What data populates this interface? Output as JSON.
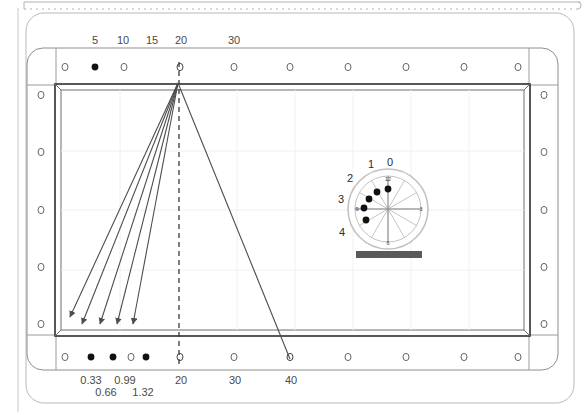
{
  "diagram": {
    "table": {
      "felt_color": "#ffffff",
      "rail_color": "#3a3a3a",
      "cushion_color": "#d9d9d9",
      "frame_color": "#8a8a8a"
    },
    "top_axis": {
      "name": "top-rail-diamond-scale",
      "labels": [
        "5",
        "10",
        "15",
        "20",
        "30"
      ],
      "positions_px": [
        95,
        123,
        152,
        180,
        233
      ]
    },
    "bottom_axis": {
      "name": "bottom-rail-diamond-scale",
      "labels": [
        "0.33",
        "0.66",
        "0.99",
        "1.32",
        "20",
        "30",
        "40"
      ],
      "positions_px": [
        91,
        104,
        123,
        141,
        180,
        233,
        289
      ],
      "rows_px": [
        380,
        392,
        380,
        392,
        380,
        380,
        380
      ]
    },
    "top_rail_markers": [
      {
        "x": 65,
        "filled": false
      },
      {
        "x": 95,
        "filled": true
      },
      {
        "x": 124,
        "filled": false
      },
      {
        "x": 180,
        "filled": false
      },
      {
        "x": 234,
        "filled": false
      },
      {
        "x": 290,
        "filled": false
      },
      {
        "x": 348,
        "filled": false
      },
      {
        "x": 406,
        "filled": false
      },
      {
        "x": 464,
        "filled": false
      },
      {
        "x": 518,
        "filled": false
      }
    ],
    "bottom_rail_markers": [
      {
        "x": 65,
        "filled": false
      },
      {
        "x": 91,
        "filled": true
      },
      {
        "x": 113,
        "filled": true
      },
      {
        "x": 131,
        "filled": false
      },
      {
        "x": 146,
        "filled": true
      },
      {
        "x": 180,
        "filled": false
      },
      {
        "x": 234,
        "filled": false
      },
      {
        "x": 290,
        "filled": false
      },
      {
        "x": 348,
        "filled": false
      },
      {
        "x": 406,
        "filled": false
      },
      {
        "x": 464,
        "filled": false
      },
      {
        "x": 518,
        "filled": false
      }
    ],
    "left_rail_markers_y": [
      95,
      152,
      210,
      265,
      322
    ],
    "right_rail_markers_y": [
      95,
      152,
      210,
      265,
      322
    ],
    "cue_apex": {
      "x": 178,
      "y": 83,
      "name": "shot-origin-point"
    },
    "shot_lines": [
      {
        "name": "shot-line-1",
        "x1": 178,
        "y1": 83,
        "x2": 69,
        "y2": 318
      },
      {
        "name": "shot-line-2",
        "x1": 178,
        "y1": 83,
        "x2": 80,
        "y2": 325
      },
      {
        "name": "shot-line-3",
        "x1": 178,
        "y1": 83,
        "x2": 98,
        "y2": 325
      },
      {
        "name": "shot-line-4",
        "x1": 178,
        "y1": 83,
        "x2": 115,
        "y2": 325
      },
      {
        "name": "shot-line-5",
        "x1": 178,
        "y1": 83,
        "x2": 131,
        "y2": 325
      }
    ],
    "long_line": {
      "name": "long-shot-line",
      "x1": 178,
      "y1": 83,
      "x2": 290,
      "y2": 360
    },
    "center_dashed_line": {
      "name": "center-reference-dashed-line",
      "x1": 179,
      "y1": 62,
      "x2": 179,
      "y2": 368
    },
    "dial": {
      "name": "tip-contact-dial",
      "center": {
        "x": 388,
        "y": 209
      },
      "outer_radius": 40,
      "inner_radius": 33,
      "outer_labels": [
        {
          "text": "0",
          "x": 390,
          "y": 163
        },
        {
          "text": "1",
          "x": 371,
          "y": 167
        },
        {
          "text": "2",
          "x": 349,
          "y": 181
        },
        {
          "text": "3",
          "x": 340,
          "y": 201
        },
        {
          "text": "4",
          "x": 341,
          "y": 234
        }
      ],
      "inner_labels": [
        {
          "text": "12",
          "x": 388,
          "y": 180
        },
        {
          "text": "3",
          "x": 421,
          "y": 212
        },
        {
          "text": "6",
          "x": 388,
          "y": 245
        },
        {
          "text": "9",
          "x": 357,
          "y": 212
        }
      ],
      "tip_dots": [
        {
          "x": 388,
          "y": 189
        },
        {
          "x": 377,
          "y": 193
        },
        {
          "x": 369,
          "y": 200
        },
        {
          "x": 364,
          "y": 209
        },
        {
          "x": 366,
          "y": 220
        }
      ],
      "spokes_count": 12,
      "base_bar": {
        "x": 356,
        "y": 251,
        "width": 66,
        "height": 7,
        "color": "#5a5a5a"
      }
    }
  }
}
